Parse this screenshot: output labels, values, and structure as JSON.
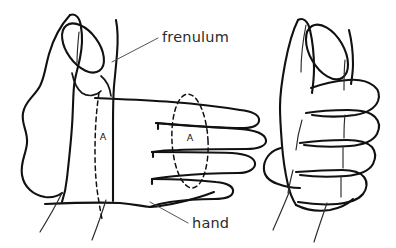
{
  "figure": {
    "kind": "line-drawing",
    "title_visible": false,
    "background_color": "#ffffff",
    "ink_color": "#111111",
    "label_color": "#2b2b2b",
    "width": 396,
    "height": 248,
    "panels": [
      {
        "id": "left-panel",
        "name": "hand-dorsal-view-with-fingers-extended",
        "description": "Left drawing: hand seen from the radial side, thumb pointing up with elliptical thumb tip, four fingers extended to the right"
      },
      {
        "id": "right-panel",
        "name": "hand-closed-fist-view",
        "description": "Right drawing: hand closed into a fist, thumb folded across the flexed fingers"
      }
    ],
    "labels": [
      {
        "id": "frenulum",
        "text": "frenulum",
        "x": 162,
        "y": 42,
        "leader_from_x": 112,
        "leader_from_y": 62,
        "leader_to_x": 158,
        "leader_to_y": 38
      },
      {
        "id": "hand",
        "text": "hand",
        "x": 192,
        "y": 228,
        "leader_from_x": 150,
        "leader_from_y": 202,
        "leader_to_x": 188,
        "leader_to_y": 223
      }
    ],
    "section_markers": [
      {
        "id": "section-a-left",
        "text": "A",
        "x": 103,
        "y": 140,
        "kind": "dashed-section-line",
        "note": "Dashed cross-section line A running down the proximal hand"
      },
      {
        "id": "section-a-middle",
        "text": "A",
        "x": 188,
        "y": 141,
        "kind": "dashed-section-ellipse",
        "note": "Dashed cross-section ellipse A encircling the fingers"
      }
    ]
  }
}
